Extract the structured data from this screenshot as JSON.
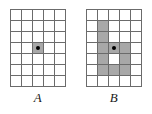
{
  "figure": {
    "type": "grid-diagram",
    "cell_size_px": 11,
    "grid_line_color": "#6b6b6b",
    "shade_color": "#a8a8a8",
    "background_color": "#ffffff",
    "dot_color": "#000000",
    "panels": [
      {
        "id": "panel-a",
        "label": "A",
        "label_style": "italic",
        "columns": 5,
        "rows": 7,
        "dot_cell": {
          "row": 4,
          "col": 3
        },
        "shaded_cells": [
          {
            "row": 4,
            "col": 3
          }
        ],
        "cells": [
          [
            0,
            0,
            0,
            0,
            0
          ],
          [
            0,
            0,
            0,
            0,
            0
          ],
          [
            0,
            0,
            0,
            0,
            0
          ],
          [
            0,
            0,
            1,
            0,
            0
          ],
          [
            0,
            0,
            0,
            0,
            0
          ],
          [
            0,
            0,
            0,
            0,
            0
          ],
          [
            0,
            0,
            0,
            0,
            0
          ]
        ]
      },
      {
        "id": "panel-b",
        "label": "B",
        "label_style": "italic",
        "columns": 5,
        "rows": 7,
        "dot_cell": {
          "row": 4,
          "col": 3
        },
        "shaded_cells": [
          {
            "row": 2,
            "col": 2
          },
          {
            "row": 3,
            "col": 2
          },
          {
            "row": 4,
            "col": 2
          },
          {
            "row": 4,
            "col": 3
          },
          {
            "row": 4,
            "col": 4
          },
          {
            "row": 5,
            "col": 2
          },
          {
            "row": 5,
            "col": 4
          },
          {
            "row": 6,
            "col": 2
          },
          {
            "row": 6,
            "col": 3
          },
          {
            "row": 6,
            "col": 4
          }
        ],
        "cells": [
          [
            0,
            0,
            0,
            0,
            0
          ],
          [
            0,
            1,
            0,
            0,
            0
          ],
          [
            0,
            1,
            0,
            0,
            0
          ],
          [
            0,
            1,
            1,
            1,
            0
          ],
          [
            0,
            1,
            0,
            1,
            0
          ],
          [
            0,
            1,
            1,
            1,
            0
          ],
          [
            0,
            0,
            0,
            0,
            0
          ]
        ]
      }
    ]
  }
}
